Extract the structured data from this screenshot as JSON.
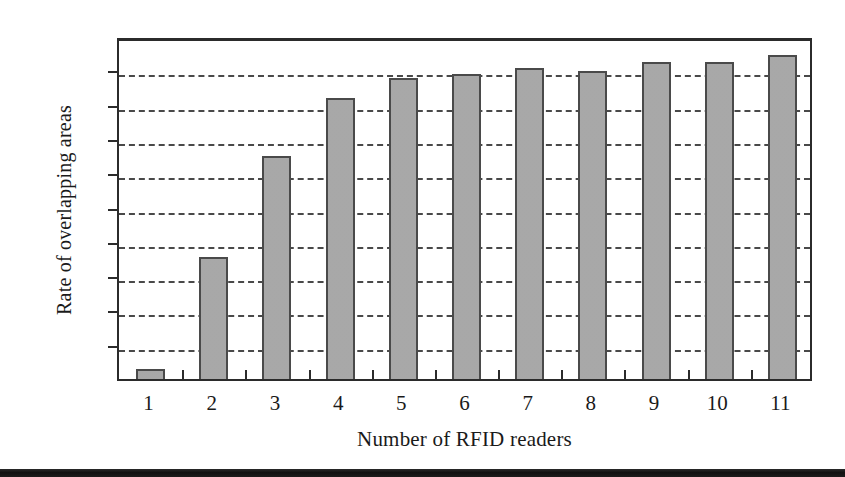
{
  "chart_data": {
    "type": "bar",
    "title": "",
    "subtitle": "",
    "xlabel": "Number of RFID readers",
    "ylabel": "Rate of overlapping areas",
    "categories": [
      "1",
      "2",
      "3",
      "4",
      "5",
      "6",
      "7",
      "8",
      "9",
      "10",
      "11"
    ],
    "values": [
      0.003,
      0.0355,
      0.065,
      0.0818,
      0.0878,
      0.0888,
      0.0908,
      0.0897,
      0.0925,
      0.0925,
      0.0945
    ],
    "series": [
      {
        "name": "Rate of overlapping areas",
        "values": [
          0.003,
          0.0355,
          0.065,
          0.0818,
          0.0878,
          0.0888,
          0.0908,
          0.0897,
          0.0925,
          0.0925,
          0.0945
        ]
      }
    ],
    "ylim": [
      0,
      0.1
    ],
    "yticks": [
      0,
      0.01,
      0.02,
      0.03,
      0.04,
      0.05,
      0.06,
      0.07,
      0.08,
      0.09,
      0.1
    ],
    "ytick_labels": [
      "0",
      "0.01",
      "0.02",
      "0.03",
      "0.04",
      "0.05",
      "0.06",
      "0.07",
      "0.08",
      "0.09",
      "0.1"
    ],
    "xtick_labels": [
      "1",
      "2",
      "3",
      "4",
      "5",
      "6",
      "7",
      "8",
      "9",
      "10",
      "11"
    ],
    "grid": "horizontal-dashed",
    "legend": "none",
    "annotations": [],
    "colors": {
      "bar_fill": "#a9a9a9",
      "bar_border": "#4a4a4a",
      "axis": "#2b2b2b",
      "gridline": "#3a3a3a",
      "text": "#1a1a1a",
      "background": "#ffffff",
      "page_edge_band": "#1c1c1c"
    }
  }
}
